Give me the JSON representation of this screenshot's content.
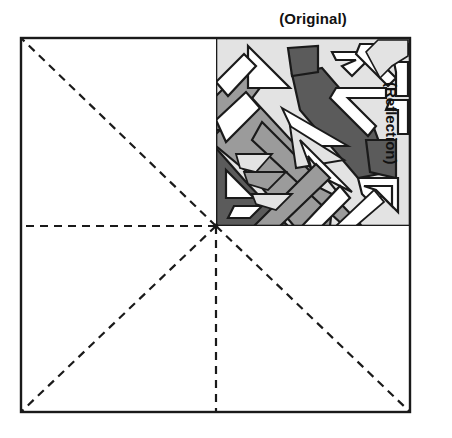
{
  "figure": {
    "title_top": "(Original)",
    "title_right": "(Reflection)",
    "square": {
      "x": 21,
      "y": 38,
      "width": 389,
      "height": 374
    },
    "center": {
      "x": 216,
      "y": 226
    },
    "colors": {
      "outline": "#1a1a1a",
      "background": "#ffffff",
      "light_gray": "#e3e3e3",
      "medium_gray": "#9b9b9b",
      "dark_gray": "#5b5b5b",
      "dashed_line": "#1a1a1a"
    },
    "symmetry_lines": [
      {
        "name": "diagonal-top-left",
        "from": [
          216,
          226
        ],
        "to": [
          21,
          38
        ]
      },
      {
        "name": "diagonal-bottom-left",
        "from": [
          216,
          226
        ],
        "to": [
          21,
          412
        ]
      },
      {
        "name": "diagonal-bottom-right",
        "from": [
          216,
          226
        ],
        "to": [
          410,
          412
        ]
      },
      {
        "name": "horizontal-left",
        "from": [
          216,
          226
        ],
        "to": [
          21,
          226
        ]
      },
      {
        "name": "vertical-down",
        "from": [
          216,
          226
        ],
        "to": [
          216,
          412
        ]
      }
    ],
    "pattern_quadrant": {
      "name": "original-motif",
      "x": 216,
      "y": 38,
      "width": 194,
      "height": 188,
      "description": "Abstract angular diagonal maze motif in four tones"
    },
    "dash": {
      "length": 8,
      "gap": 6,
      "width": 2.2
    }
  }
}
